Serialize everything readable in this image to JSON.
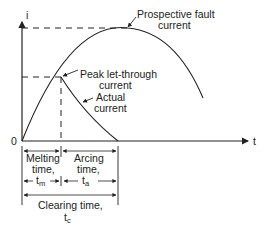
{
  "axes": {
    "y_label": "i",
    "x_label": "t",
    "origin_label": "0"
  },
  "curves": {
    "prospective": {
      "label_line1": "Prospective fault",
      "label_line2": "current"
    },
    "peak": {
      "label_line1": "Peak let-through",
      "label_line2": "current"
    },
    "actual": {
      "label_line1": "Actual",
      "label_line2": "current"
    }
  },
  "intervals": {
    "melting": {
      "line1": "Melting",
      "line2": "time,",
      "symbol": "t",
      "sub": "m"
    },
    "arcing": {
      "line1": "Arcing",
      "line2": "time,",
      "symbol": "t",
      "sub": "a"
    },
    "clearing": {
      "line1": "Clearing time,",
      "symbol": "t",
      "sub": "c"
    }
  },
  "colors": {
    "ink": "#222222",
    "background": "#ffffff"
  }
}
